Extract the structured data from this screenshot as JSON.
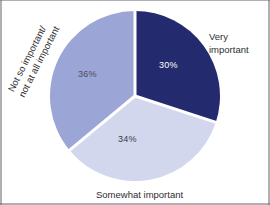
{
  "chart_data": {
    "type": "pie",
    "title": "",
    "subtitle": "",
    "xlabel": "",
    "ylabel": "",
    "legend_position": "callout-labels",
    "grid": false,
    "categories": [
      "Very important",
      "Somewhat important",
      "Not so important/ not at all important"
    ],
    "values": [
      30,
      34,
      36
    ],
    "value_labels": [
      "30%",
      "34%",
      "36%"
    ],
    "colors": [
      "#232a6d",
      "#d2d7ee",
      "#9ba5d6"
    ],
    "slices": [
      {
        "label": "Very important",
        "label_lines": [
          "Very",
          "important"
        ],
        "value": 30,
        "value_label": "30%",
        "color": "#232a6d",
        "value_label_color": "#ffffff",
        "start_angle_deg": 0,
        "end_angle_deg": 108
      },
      {
        "label": "Somewhat important",
        "label_lines": [
          "Somewhat important"
        ],
        "value": 34,
        "value_label": "34%",
        "color": "#d2d7ee",
        "value_label_color": "#3b3b47",
        "start_angle_deg": 108,
        "end_angle_deg": 230.4
      },
      {
        "label": "Not so important/ not at all important",
        "label_lines": [
          "Not so important/",
          "not at all important"
        ],
        "value": 36,
        "value_label": "36%",
        "color": "#9ba5d6",
        "value_label_color": "#4a4a5a",
        "start_angle_deg": 230.4,
        "end_angle_deg": 360
      }
    ],
    "geometry": {
      "center_x": 87,
      "center_y": 87,
      "radius": 85,
      "separator_color": "#ffffff",
      "separator_width": 3
    },
    "background_color": "#ffffff"
  },
  "labels": {
    "very_line1": "Very",
    "very_line2": "important",
    "somewhat": "Somewhat important",
    "notso_line1": "Not so important/",
    "notso_line2": "not at all important"
  },
  "percents": {
    "very": "30%",
    "somewhat": "34%",
    "notso": "36%"
  }
}
